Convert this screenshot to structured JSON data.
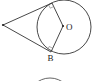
{
  "diagram": {
    "type": "geometry",
    "labels": {
      "center": "O",
      "tangent_point_bottom": "B",
      "external_point": "P",
      "tangent_point_top": "A"
    },
    "colors": {
      "stroke": "#333333",
      "background": "#ffffff"
    },
    "elements": {
      "circle": {
        "cx": 64,
        "cy": 27,
        "r": 27
      },
      "center_point": {
        "x": 63,
        "y": 26
      },
      "external_point": {
        "x": 3,
        "y": 25
      },
      "tangent_point_a": {
        "x": 52,
        "y": 3
      },
      "tangent_point_b": {
        "x": 51,
        "y": 52
      },
      "partial_circle_bottom": {
        "cx": 50,
        "cy": 100,
        "r": 22
      }
    }
  }
}
